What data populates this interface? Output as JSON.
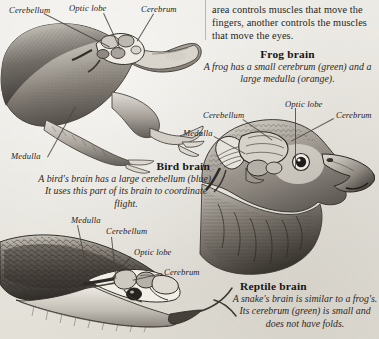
{
  "page": {
    "background_color": "#e9e7e1",
    "ink_color": "#2b2622"
  },
  "column_text": {
    "paragraph": "area controls muscles that move the fingers, another controls the muscles that move the eyes."
  },
  "figures": [
    {
      "id": "frog",
      "name": "frog-illustration",
      "alt": "Engraving of a frog in profile with the brain exposed on top of the head",
      "caption_title": "Frog brain",
      "caption_body": "A frog has a small cerebrum (green) and a large medulla (orange).",
      "labels": [
        {
          "text": "Cerebellum",
          "x": 9,
          "y": 5
        },
        {
          "text": "Optic lobe",
          "x": 69,
          "y": 3
        },
        {
          "text": "Cerebrum",
          "x": 141,
          "y": 4
        },
        {
          "text": "Medulla",
          "x": 11,
          "y": 151
        }
      ]
    },
    {
      "id": "bird",
      "name": "hawk-illustration",
      "alt": "Engraving of a hawk head in profile with the brain exposed",
      "caption_title": "Bird brain",
      "caption_body": "A bird's brain has a large cerebellum (blue). It uses this part of its brain to coordinate flight.",
      "labels": [
        {
          "text": "Optic lobe",
          "x": 285,
          "y": 99
        },
        {
          "text": "Cerebellum",
          "x": 203,
          "y": 110
        },
        {
          "text": "Cerebrum",
          "x": 336,
          "y": 110
        },
        {
          "text": "Medulla",
          "x": 183,
          "y": 128
        }
      ]
    },
    {
      "id": "reptile",
      "name": "snake-illustration",
      "alt": "Engraving of a snake head with forked tongue and the brain exposed",
      "caption_title": "Reptile brain",
      "caption_body": "A snake's brain is similar to a frog's. Its cerebrum (green) is small and does not have folds.",
      "labels": [
        {
          "text": "Medulla",
          "x": 71,
          "y": 215
        },
        {
          "text": "Cerebellum",
          "x": 106,
          "y": 226
        },
        {
          "text": "Optic lobe",
          "x": 134,
          "y": 247
        },
        {
          "text": "Cerebrum",
          "x": 164,
          "y": 267
        }
      ]
    }
  ],
  "anatomy_colors": {
    "cerebrum": "green",
    "medulla": "orange",
    "cerebellum": "blue"
  }
}
